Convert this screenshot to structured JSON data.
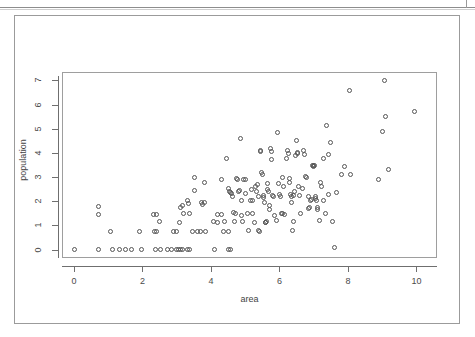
{
  "figure": {
    "background_color": "#ffffff",
    "frame_color": "#9b9b9b",
    "axis_color": "#6f6f6f",
    "point_color": "#555555"
  },
  "chart_data": {
    "type": "scatter",
    "title": "",
    "subtitle": "",
    "xlabel": "area",
    "ylabel": "population",
    "xlim": [
      -0.35,
      10.6
    ],
    "ylim": [
      -0.35,
      7.35
    ],
    "xticks": [
      0,
      2,
      4,
      6,
      8,
      10
    ],
    "yticks": [
      0,
      1,
      2,
      3,
      4,
      5,
      6,
      7
    ],
    "xtick_labels": [
      "0",
      "2",
      "4",
      "6",
      "8",
      "10"
    ],
    "ytick_labels": [
      "0",
      "1",
      "2",
      "3",
      "4",
      "5",
      "6",
      "7"
    ],
    "grid": false,
    "legend": null,
    "marker": "open-circle",
    "marker_size": 5,
    "n_points": 196,
    "points": [
      [
        0.02,
        0.02
      ],
      [
        0.72,
        1.8
      ],
      [
        0.72,
        1.45
      ],
      [
        0.72,
        0.02
      ],
      [
        1.08,
        0.75
      ],
      [
        1.12,
        0.02
      ],
      [
        1.32,
        0.02
      ],
      [
        1.5,
        0.02
      ],
      [
        1.68,
        0.02
      ],
      [
        1.9,
        0.75
      ],
      [
        1.98,
        0.02
      ],
      [
        2.32,
        1.45
      ],
      [
        2.42,
        1.45
      ],
      [
        2.34,
        0.75
      ],
      [
        2.42,
        0.75
      ],
      [
        2.38,
        0.02
      ],
      [
        2.52,
        0.02
      ],
      [
        2.5,
        1.15
      ],
      [
        2.72,
        0.02
      ],
      [
        2.86,
        0.02
      ],
      [
        2.9,
        0.75
      ],
      [
        2.98,
        0.75
      ],
      [
        3.0,
        0.02
      ],
      [
        3.06,
        0.02
      ],
      [
        3.12,
        0.02
      ],
      [
        3.18,
        0.02
      ],
      [
        3.08,
        1.12
      ],
      [
        3.1,
        1.72
      ],
      [
        3.18,
        1.82
      ],
      [
        3.2,
        1.5
      ],
      [
        3.3,
        0.02
      ],
      [
        3.38,
        0.02
      ],
      [
        3.3,
        2.02
      ],
      [
        3.34,
        1.92
      ],
      [
        3.38,
        1.5
      ],
      [
        3.46,
        0.75
      ],
      [
        3.52,
        2.98
      ],
      [
        3.52,
        2.45
      ],
      [
        3.6,
        0.75
      ],
      [
        3.68,
        0.75
      ],
      [
        3.72,
        1.95
      ],
      [
        3.74,
        1.85
      ],
      [
        3.8,
        2.78
      ],
      [
        3.82,
        1.95
      ],
      [
        3.84,
        0.75
      ],
      [
        4.06,
        1.18
      ],
      [
        4.1,
        0.02
      ],
      [
        4.18,
        1.12
      ],
      [
        4.2,
        1.45
      ],
      [
        4.3,
        1.45
      ],
      [
        4.32,
        2.88
      ],
      [
        4.36,
        0.75
      ],
      [
        4.4,
        1.18
      ],
      [
        4.44,
        3.75
      ],
      [
        4.5,
        0.02
      ],
      [
        4.58,
        0.02
      ],
      [
        4.52,
        0.75
      ],
      [
        4.5,
        2.52
      ],
      [
        4.54,
        2.42
      ],
      [
        4.58,
        2.38
      ],
      [
        4.6,
        2.3
      ],
      [
        4.62,
        2.18
      ],
      [
        4.66,
        1.55
      ],
      [
        4.68,
        1.15
      ],
      [
        4.72,
        1.48
      ],
      [
        4.74,
        2.95
      ],
      [
        4.78,
        2.92
      ],
      [
        4.8,
        2.4
      ],
      [
        4.82,
        2.45
      ],
      [
        4.86,
        4.58
      ],
      [
        4.88,
        2.02
      ],
      [
        4.9,
        1.42
      ],
      [
        4.92,
        1.18
      ],
      [
        4.96,
        2.88
      ],
      [
        5.0,
        2.92
      ],
      [
        5.02,
        2.32
      ],
      [
        5.06,
        1.48
      ],
      [
        5.1,
        0.78
      ],
      [
        5.14,
        2.05
      ],
      [
        5.18,
        2.48
      ],
      [
        5.2,
        1.48
      ],
      [
        5.22,
        2.02
      ],
      [
        5.26,
        1.12
      ],
      [
        5.3,
        2.62
      ],
      [
        5.32,
        2.42
      ],
      [
        5.36,
        2.7
      ],
      [
        5.38,
        2.18
      ],
      [
        5.4,
        0.78
      ],
      [
        5.42,
        0.75
      ],
      [
        5.44,
        4.12
      ],
      [
        5.46,
        4.05
      ],
      [
        5.48,
        3.2
      ],
      [
        5.5,
        3.1
      ],
      [
        5.52,
        2.25
      ],
      [
        5.54,
        2.15
      ],
      [
        5.56,
        1.95
      ],
      [
        5.58,
        1.12
      ],
      [
        5.6,
        1.12
      ],
      [
        5.62,
        1.18
      ],
      [
        5.64,
        2.72
      ],
      [
        5.66,
        2.5
      ],
      [
        5.68,
        2.42
      ],
      [
        5.7,
        1.82
      ],
      [
        5.72,
        1.65
      ],
      [
        5.74,
        4.18
      ],
      [
        5.76,
        4.05
      ],
      [
        5.78,
        3.72
      ],
      [
        5.8,
        2.25
      ],
      [
        5.82,
        2.18
      ],
      [
        5.86,
        1.42
      ],
      [
        5.9,
        1.2
      ],
      [
        5.94,
        4.85
      ],
      [
        5.98,
        2.72
      ],
      [
        6.0,
        2.28
      ],
      [
        6.02,
        2.2
      ],
      [
        6.06,
        1.5
      ],
      [
        6.08,
        1.48
      ],
      [
        6.1,
        2.98
      ],
      [
        6.12,
        2.62
      ],
      [
        6.14,
        1.45
      ],
      [
        6.2,
        3.78
      ],
      [
        6.24,
        4.08
      ],
      [
        6.26,
        3.98
      ],
      [
        6.28,
        2.95
      ],
      [
        6.3,
        2.78
      ],
      [
        6.32,
        2.28
      ],
      [
        6.34,
        2.2
      ],
      [
        6.36,
        1.95
      ],
      [
        6.38,
        0.78
      ],
      [
        6.4,
        1.18
      ],
      [
        6.42,
        2.25
      ],
      [
        6.44,
        2.42
      ],
      [
        6.46,
        3.88
      ],
      [
        6.5,
        4.52
      ],
      [
        6.52,
        4.02
      ],
      [
        6.54,
        3.98
      ],
      [
        6.56,
        2.62
      ],
      [
        6.58,
        2.25
      ],
      [
        6.62,
        1.48
      ],
      [
        6.66,
        2.52
      ],
      [
        6.7,
        4.08
      ],
      [
        6.74,
        3.95
      ],
      [
        6.76,
        3.02
      ],
      [
        6.8,
        2.98
      ],
      [
        6.84,
        2.18
      ],
      [
        6.86,
        1.68
      ],
      [
        6.88,
        1.72
      ],
      [
        6.9,
        2.02
      ],
      [
        6.94,
        2.08
      ],
      [
        6.96,
        3.48
      ],
      [
        6.98,
        3.45
      ],
      [
        7.0,
        3.5
      ],
      [
        7.02,
        3.46
      ],
      [
        7.04,
        2.12
      ],
      [
        7.06,
        2.18
      ],
      [
        7.08,
        2.05
      ],
      [
        7.1,
        1.72
      ],
      [
        7.12,
        1.65
      ],
      [
        7.16,
        1.2
      ],
      [
        7.2,
        2.78
      ],
      [
        7.24,
        2.62
      ],
      [
        7.28,
        3.78
      ],
      [
        7.3,
        2.02
      ],
      [
        7.34,
        1.48
      ],
      [
        7.38,
        5.12
      ],
      [
        7.42,
        3.95
      ],
      [
        7.44,
        2.28
      ],
      [
        7.5,
        4.42
      ],
      [
        7.56,
        1.18
      ],
      [
        7.6,
        0.1
      ],
      [
        7.66,
        2.38
      ],
      [
        7.82,
        3.12
      ],
      [
        7.9,
        3.45
      ],
      [
        8.05,
        6.6
      ],
      [
        8.08,
        3.1
      ],
      [
        8.88,
        2.88
      ],
      [
        9.02,
        4.88
      ],
      [
        9.08,
        7.0
      ],
      [
        9.1,
        5.52
      ],
      [
        9.18,
        3.32
      ],
      [
        9.95,
        5.72
      ]
    ]
  }
}
